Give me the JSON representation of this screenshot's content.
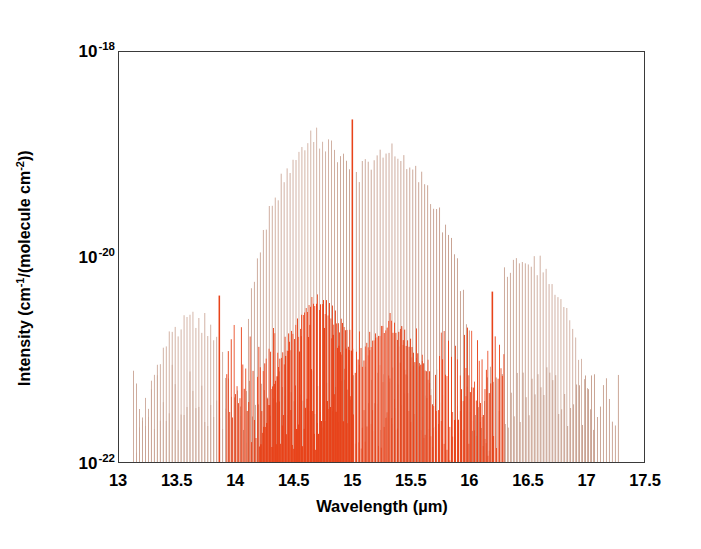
{
  "figure": {
    "background_color": "#ffffff",
    "frame_color": "#3a3a3a"
  },
  "axes": {
    "x": {
      "title_prefix": "Wavelength (",
      "title_unit": "µm",
      "title_suffix": ")",
      "title_full": "Wavelength (µm)",
      "min": 13.0,
      "max": 17.5,
      "major_step": 0.5,
      "minor_per_major": 5,
      "tick_labels": [
        "13",
        "13.5",
        "14",
        "14.5",
        "15",
        "15.5",
        "16",
        "16.5",
        "17",
        "17.5"
      ],
      "tick_values": [
        13,
        13.5,
        14,
        14.5,
        15,
        15.5,
        16,
        16.5,
        17,
        17.5
      ]
    },
    "y": {
      "title_full": "Intensity (cm-1/(molecule cm-2))",
      "title_part1": "Intensity (cm",
      "title_exp1": "-1",
      "title_part2": "/(molecule cm",
      "title_exp2": "-2",
      "title_part3": "))",
      "scale": "log",
      "min": 1e-22,
      "max": 1e-18,
      "decade_labels": [
        {
          "mantissa": "10",
          "exponent": "-18",
          "value": 1e-18
        },
        {
          "mantissa": "10",
          "exponent": "-20",
          "value": 1e-20
        },
        {
          "mantissa": "10",
          "exponent": "-22",
          "value": 1e-22
        }
      ]
    }
  },
  "chart_data": {
    "type": "bar",
    "subtype": "stick-spectrum",
    "title": "",
    "xlabel": "Wavelength (µm)",
    "ylabel": "Intensity (cm-1/(molecule cm-2))",
    "xlim": [
      13.0,
      17.5
    ],
    "ylim": [
      1e-22,
      1e-18
    ],
    "yscale": "log",
    "grid": false,
    "legend": "none",
    "series": [
      {
        "name": "main-band-sticks",
        "color": "#c9a393",
        "description": "Tan stick lines forming broad P/R branch envelopes peaking near 14.7 and 15.3 micrometres with a weaker envelope near 16.5 micrometres",
        "line_spacing_um": 0.0255,
        "envelopes": [
          {
            "center": 13.62,
            "half_width": 0.52,
            "peak_intensity": 3e-21,
            "range": [
              13.12,
              14.12
            ]
          },
          {
            "center": 14.72,
            "half_width": 0.62,
            "peak_intensity": 1.6e-19,
            "range": [
              14.08,
              15.0
            ]
          },
          {
            "center": 15.3,
            "half_width": 0.7,
            "peak_intensity": 1.2e-19,
            "range": [
              15.03,
              16.1
            ]
          },
          {
            "center": 16.48,
            "half_width": 0.6,
            "peak_intensity": 1.1e-20,
            "range": [
              16.3,
              17.28
            ]
          }
        ]
      },
      {
        "name": "hot-band-and-isotopologue-sticks",
        "color": "#e8431a",
        "description": "Orange-red stick lines: dense weak manifold between 13.9 and 16.3 micrometres with strong isolated spikes near 13.86, 15.00 and 16.20 micrometres",
        "line_spacing_um": 0.0125,
        "envelopes": [
          {
            "center": 14.72,
            "half_width": 0.55,
            "peak_intensity": 3.8e-21,
            "range": [
              14.05,
              15.0
            ]
          },
          {
            "center": 15.32,
            "half_width": 0.55,
            "peak_intensity": 2.4e-21,
            "range": [
              15.02,
              15.95
            ]
          },
          {
            "center": 16.0,
            "half_width": 0.25,
            "peak_intensity": 6e-22,
            "range": [
              15.82,
              16.22
            ]
          }
        ],
        "strong_lines": [
          {
            "wavelength": 13.86,
            "intensity": 4.2e-21
          },
          {
            "wavelength": 15.0,
            "intensity": 2.2e-19
          },
          {
            "wavelength": 16.2,
            "intensity": 4.6e-21
          }
        ]
      }
    ]
  }
}
